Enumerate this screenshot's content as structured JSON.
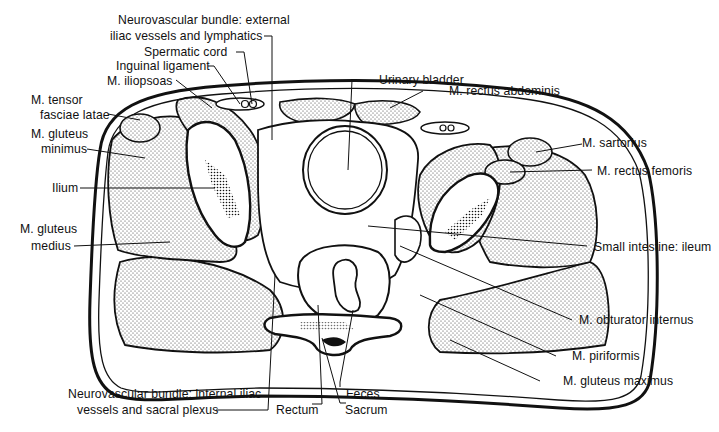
{
  "figure": {
    "type": "anatomical cross-section",
    "colors": {
      "ink": "#111111",
      "stipple": "#cfcfcf",
      "background": "#ffffff"
    }
  },
  "labels": {
    "nv_external_1": "Neurovascular bundle: external",
    "nv_external_2": "iliac vessels and lymphatics",
    "spermatic_cord": "Spermatic cord",
    "inguinal_ligament": "Inguinal ligament",
    "iliopsoas": "M. iliopsoas",
    "tensor_1": "M. tensor",
    "tensor_2": "fasciae latae",
    "gluteus_minimus_1": "M. gluteus",
    "gluteus_minimus_2": "minimus",
    "ilium": "Ilium",
    "gluteus_medius_1": "M. gluteus",
    "gluteus_medius_2": "medius",
    "urinary_bladder": "Urinary bladder",
    "rectus_abdominis": "M. rectus abdominis",
    "sartorius": "M. sartorius",
    "rectus_femoris": "M. rectus femoris",
    "small_intestine": "Small intestine: ileum",
    "obturator_internus": "M. obturator internus",
    "piriformis": "M. piriformis",
    "gluteus_maximus": "M. gluteus maximus",
    "nv_internal_1": "Neurovascular bundle: internal iliac",
    "nv_internal_2": "vessels and sacral plexus",
    "rectum": "Rectum",
    "feces": "Feces",
    "sacrum": "Sacrum"
  }
}
